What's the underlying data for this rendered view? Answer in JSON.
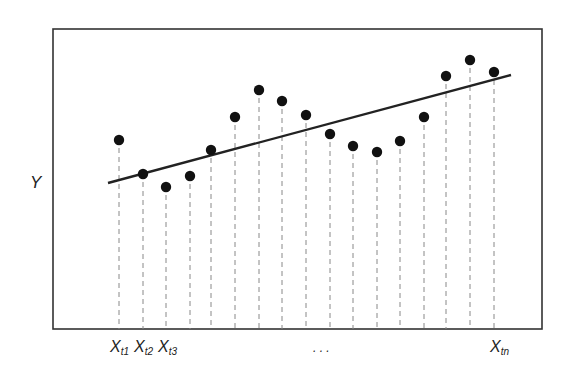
{
  "diagram": {
    "y_axis_label": "Y",
    "x_labels": [
      {
        "main": "X",
        "sub": "t1"
      },
      {
        "main": "X",
        "sub": "t2"
      },
      {
        "main": "X",
        "sub": "t3"
      },
      {
        "main": "X",
        "sub": "tn"
      }
    ],
    "ellipsis": ". . .",
    "colors": {
      "frame": "#333333",
      "points": "#111111",
      "line": "#222222",
      "guides": "#888888"
    }
  },
  "chart_data": {
    "type": "scatter",
    "title": "",
    "xlabel": "",
    "ylabel": "Y",
    "x_tick_labels": [
      "Xt1",
      "Xt2",
      "Xt3",
      "...",
      "Xtn"
    ],
    "points_px": [
      [
        119,
        140
      ],
      [
        143,
        174
      ],
      [
        166,
        187
      ],
      [
        190,
        176
      ],
      [
        211,
        150
      ],
      [
        235,
        117
      ],
      [
        259,
        90
      ],
      [
        282,
        101
      ],
      [
        306,
        115
      ],
      [
        330,
        134
      ],
      [
        353,
        146
      ],
      [
        377,
        152
      ],
      [
        400,
        141
      ],
      [
        424,
        117
      ],
      [
        446,
        76
      ],
      [
        470,
        60
      ],
      [
        494,
        72
      ]
    ],
    "trend_line_px": [
      [
        108,
        183
      ],
      [
        511,
        75
      ]
    ],
    "grid": false,
    "legend": null
  }
}
